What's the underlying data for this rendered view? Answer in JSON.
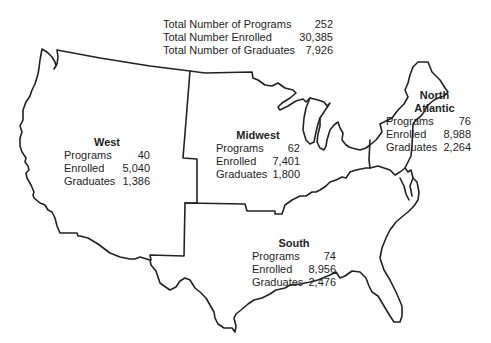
{
  "totals": {
    "rows": [
      {
        "label": "Total Number of Programs",
        "value": "252"
      },
      {
        "label": "Total Number Enrolled",
        "value": "30,385"
      },
      {
        "label": "Total Number of Graduates",
        "value": "7,926"
      }
    ]
  },
  "regions": {
    "west": {
      "title": "West",
      "rows": [
        {
          "label": "Programs",
          "value": "40"
        },
        {
          "label": "Enrolled",
          "value": "5,040"
        },
        {
          "label": "Graduates",
          "value": "1,386"
        }
      ]
    },
    "midwest": {
      "title": "Midwest",
      "rows": [
        {
          "label": "Programs",
          "value": "62"
        },
        {
          "label": "Enrolled",
          "value": "7,401"
        },
        {
          "label": "Graduates",
          "value": "1,800"
        }
      ]
    },
    "north_atlantic": {
      "title_line1": "North",
      "title_line2": "Atlantic",
      "rows": [
        {
          "label": "Programs",
          "value": "76"
        },
        {
          "label": "Enrolled",
          "value": "8,988"
        },
        {
          "label": "Graduates",
          "value": "2,264"
        }
      ]
    },
    "south": {
      "title": "South",
      "rows": [
        {
          "label": "Programs",
          "value": "74"
        },
        {
          "label": "Enrolled",
          "value": "8,956"
        },
        {
          "label": "Graduates",
          "value": "2,476"
        }
      ]
    }
  },
  "map": {
    "subject": "United States regional map",
    "stroke_color": "#222222"
  }
}
